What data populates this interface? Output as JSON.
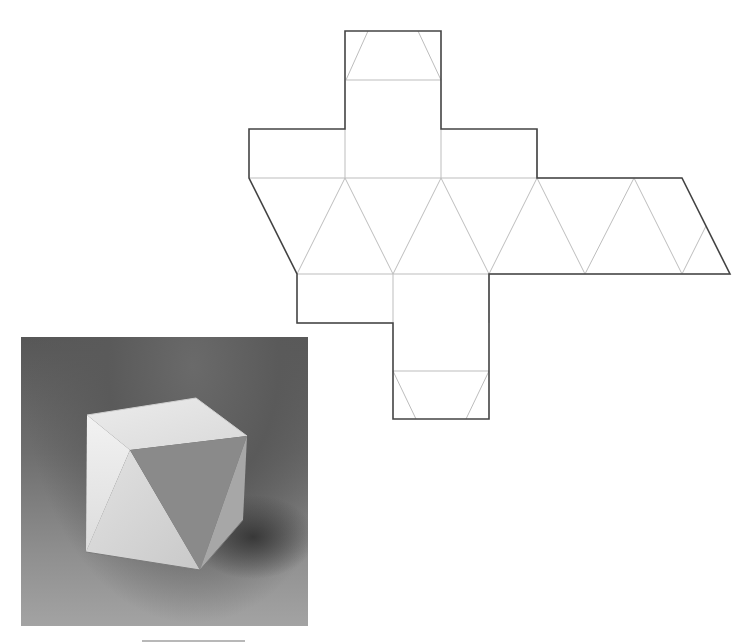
{
  "figure": {
    "caption": "",
    "net": {
      "title": "Paper net for the octahedral cube model",
      "cut_line_color": "#444444",
      "fold_line_color": "#bdbdbd",
      "cut_polygon": "345,31 441,31 441,129 537,129 537,178 682,178 730,274 489,274 489,323 489,419 393,419 393,323 297,323 297,274 249,178 249,129 345,129",
      "fold_lines": [
        "249,178 682,178",
        "297,274 730,274",
        "346,80 441,80",
        "393,371 489,371",
        "368,31 346,80",
        "418,31 441,80",
        "416,419 393,371",
        "466,419 489,371",
        "297,274 345,178",
        "345,178 393,274",
        "393,274 441,178",
        "441,178 489,274",
        "489,274 537,178",
        "537,178 585,274",
        "585,274 634,178",
        "634,178 682,274",
        "682,274 706,226",
        "345,129 345,178",
        "441,129 441,178",
        "537,129 537,178",
        "393,274 393,323",
        "489,274 489,323",
        "297,323 393,323"
      ]
    },
    "photo": {
      "subject": "Assembled white paper cube with triangular faces",
      "shadow_color": "#3a3a3a"
    }
  }
}
